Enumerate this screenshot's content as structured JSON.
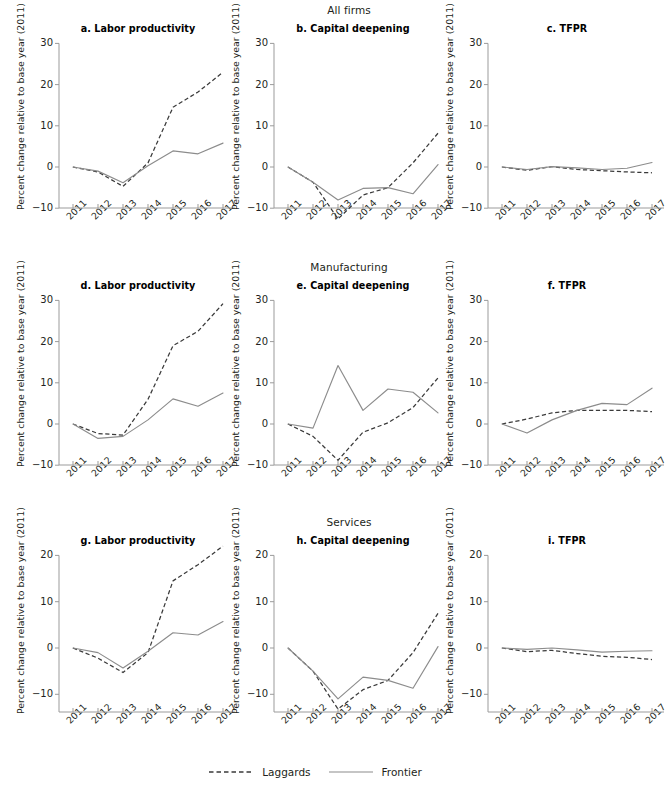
{
  "figure": {
    "width": 629,
    "height": 790,
    "background": "#ffffff"
  },
  "row_titles": [
    "All firms",
    "Manufacturing",
    "Services"
  ],
  "legend": {
    "items": [
      {
        "label": "Laggards",
        "style": "dashed",
        "color": "#3a3a3a"
      },
      {
        "label": "Frontier",
        "style": "solid",
        "color": "#8c8c8c"
      }
    ]
  },
  "axis": {
    "ylabel": "Percent change relative to base year (2011)",
    "xticklabels": [
      "2011",
      "2012",
      "2013",
      "2014",
      "2015",
      "2016",
      "2017"
    ],
    "yticklabels_row12": [
      "30",
      "20",
      "10",
      "0",
      "−10"
    ],
    "yticklabels_row3": [
      "20",
      "10",
      "0",
      "−10"
    ]
  },
  "chart_data": [
    {
      "type": "line",
      "title": "a. Labor productivity",
      "group": "All firms",
      "xlabel": "",
      "ylabel": "Percent change relative to base year (2011)",
      "x": [
        2011,
        2012,
        2013,
        2014,
        2015,
        2016,
        2017
      ],
      "xlim": [
        2011,
        2017
      ],
      "ylim": [
        -14,
        30
      ],
      "yticks": [
        -10,
        0,
        10,
        20,
        30
      ],
      "grid": false,
      "legend_position": "figure-bottom",
      "series": [
        {
          "name": "Laggards",
          "values": [
            0.0,
            -1.2,
            -4.7,
            1.0,
            14.5,
            18.2,
            23.0
          ]
        },
        {
          "name": "Frontier",
          "values": [
            0.0,
            -1.0,
            -3.8,
            0.3,
            3.9,
            3.2,
            5.8
          ]
        }
      ]
    },
    {
      "type": "line",
      "title": "b. Capital deepening",
      "group": "All firms",
      "xlabel": "",
      "ylabel": "Percent change relative to base year (2011)",
      "x": [
        2011,
        2012,
        2013,
        2014,
        2015,
        2016,
        2017
      ],
      "xlim": [
        2011,
        2017
      ],
      "ylim": [
        -14,
        30
      ],
      "yticks": [
        -10,
        0,
        10,
        20,
        30
      ],
      "grid": false,
      "legend_position": "figure-bottom",
      "series": [
        {
          "name": "Laggards",
          "values": [
            0.0,
            -3.7,
            -12.6,
            -6.8,
            -5.0,
            1.0,
            8.2
          ]
        },
        {
          "name": "Frontier",
          "values": [
            0.0,
            -3.7,
            -8.0,
            -5.2,
            -5.0,
            -6.5,
            0.6
          ]
        }
      ]
    },
    {
      "type": "line",
      "title": "c. TFPR",
      "group": "All firms",
      "xlabel": "",
      "ylabel": "Percent change relative to base year (2011)",
      "x": [
        2011,
        2012,
        2013,
        2014,
        2015,
        2016,
        2017
      ],
      "xlim": [
        2011,
        2017
      ],
      "ylim": [
        -14,
        30
      ],
      "yticks": [
        -10,
        0,
        10,
        20,
        30
      ],
      "grid": false,
      "legend_position": "figure-bottom",
      "series": [
        {
          "name": "Laggards",
          "values": [
            0.0,
            -0.8,
            0.1,
            -0.6,
            -0.9,
            -1.2,
            -1.4
          ]
        },
        {
          "name": "Frontier",
          "values": [
            0.0,
            -0.6,
            0.1,
            -0.2,
            -0.6,
            -0.3,
            1.1
          ]
        }
      ]
    },
    {
      "type": "line",
      "title": "d. Labor productivity",
      "group": "Manufacturing",
      "xlabel": "",
      "ylabel": "Percent change relative to base year (2011)",
      "x": [
        2011,
        2012,
        2013,
        2014,
        2015,
        2016,
        2017
      ],
      "xlim": [
        2011,
        2017
      ],
      "ylim": [
        -14,
        30
      ],
      "yticks": [
        -10,
        0,
        10,
        20,
        30
      ],
      "grid": false,
      "legend_position": "figure-bottom",
      "series": [
        {
          "name": "Laggards",
          "values": [
            0.0,
            -2.3,
            -2.7,
            6.0,
            19.0,
            22.5,
            29.2
          ]
        },
        {
          "name": "Frontier",
          "values": [
            0.0,
            -3.5,
            -3.0,
            1.0,
            6.1,
            4.3,
            7.5
          ]
        }
      ]
    },
    {
      "type": "line",
      "title": "e. Capital deepening",
      "group": "Manufacturing",
      "xlabel": "",
      "ylabel": "Percent change relative to base year (2011)",
      "x": [
        2011,
        2012,
        2013,
        2014,
        2015,
        2016,
        2017
      ],
      "xlim": [
        2011,
        2017
      ],
      "ylim": [
        -14,
        30
      ],
      "yticks": [
        -10,
        0,
        10,
        20,
        30
      ],
      "grid": false,
      "legend_position": "figure-bottom",
      "series": [
        {
          "name": "Laggards",
          "values": [
            0.0,
            -3.0,
            -8.8,
            -2.0,
            0.3,
            4.0,
            11.2
          ]
        },
        {
          "name": "Frontier",
          "values": [
            0.0,
            -1.0,
            14.2,
            3.3,
            8.5,
            7.7,
            2.7
          ]
        }
      ]
    },
    {
      "type": "line",
      "title": "f. TFPR",
      "group": "Manufacturing",
      "xlabel": "",
      "ylabel": "Percent change relative to base year (2011)",
      "x": [
        2011,
        2012,
        2013,
        2014,
        2015,
        2016,
        2017
      ],
      "xlim": [
        2011,
        2017
      ],
      "ylim": [
        -14,
        30
      ],
      "yticks": [
        -10,
        0,
        10,
        20,
        30
      ],
      "grid": false,
      "legend_position": "figure-bottom",
      "series": [
        {
          "name": "Laggards",
          "values": [
            0.0,
            1.2,
            2.7,
            3.3,
            3.3,
            3.3,
            3.0
          ]
        },
        {
          "name": "Frontier",
          "values": [
            0.0,
            -2.2,
            1.0,
            3.3,
            5.0,
            4.7,
            8.7
          ]
        }
      ]
    },
    {
      "type": "line",
      "title": "g. Labor productivity",
      "group": "Services",
      "xlabel": "",
      "ylabel": "Percent change relative to base year (2011)",
      "x": [
        2011,
        2012,
        2013,
        2014,
        2015,
        2016,
        2017
      ],
      "xlim": [
        2011,
        2017
      ],
      "ylim": [
        -14,
        23
      ],
      "yticks": [
        -10,
        0,
        10,
        20
      ],
      "grid": false,
      "legend_position": "figure-bottom",
      "series": [
        {
          "name": "Laggards",
          "values": [
            0.0,
            -2.2,
            -5.3,
            -1.0,
            14.5,
            18.0,
            22.0
          ]
        },
        {
          "name": "Frontier",
          "values": [
            0.0,
            -1.0,
            -4.3,
            -0.7,
            3.3,
            2.8,
            5.7
          ]
        }
      ]
    },
    {
      "type": "line",
      "title": "h. Capital deepening",
      "group": "Services",
      "xlabel": "",
      "ylabel": "Percent change relative to base year (2011)",
      "x": [
        2011,
        2012,
        2013,
        2014,
        2015,
        2016,
        2017
      ],
      "xlim": [
        2011,
        2017
      ],
      "ylim": [
        -14,
        23
      ],
      "yticks": [
        -10,
        0,
        10,
        20
      ],
      "grid": false,
      "legend_position": "figure-bottom",
      "series": [
        {
          "name": "Laggards",
          "values": [
            0.0,
            -5.0,
            -13.2,
            -9.0,
            -7.0,
            -1.0,
            7.5
          ]
        },
        {
          "name": "Frontier",
          "values": [
            0.0,
            -5.0,
            -11.0,
            -6.3,
            -7.0,
            -8.7,
            0.3
          ]
        }
      ]
    },
    {
      "type": "line",
      "title": "i. TFPR",
      "group": "Services",
      "xlabel": "",
      "ylabel": "Percent change relative to base year (2011)",
      "x": [
        2011,
        2012,
        2013,
        2014,
        2015,
        2016,
        2017
      ],
      "xlim": [
        2011,
        2017
      ],
      "ylim": [
        -14,
        23
      ],
      "yticks": [
        -10,
        0,
        10,
        20
      ],
      "grid": false,
      "legend_position": "figure-bottom",
      "series": [
        {
          "name": "Laggards",
          "values": [
            0.0,
            -0.8,
            -0.5,
            -1.2,
            -1.8,
            -2.0,
            -2.5
          ]
        },
        {
          "name": "Frontier",
          "values": [
            0.0,
            -0.3,
            0.0,
            -0.4,
            -0.9,
            -0.7,
            -0.6
          ]
        }
      ]
    }
  ]
}
